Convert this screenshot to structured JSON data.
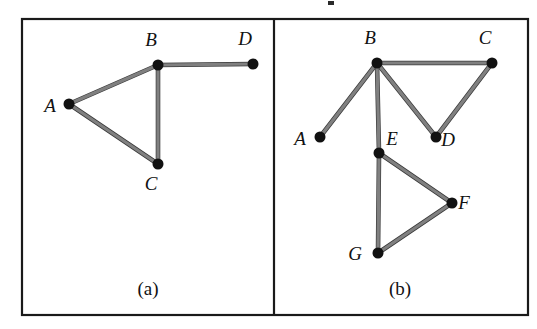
{
  "figure": {
    "type": "graph-diagram",
    "border_color": "#1a1a1a",
    "edge_color": "#808080",
    "edge_outline_color": "#3a3a3a",
    "node_color": "#111111",
    "label_color": "#111111",
    "background_color": "#ffffff",
    "frame": {
      "x": 21,
      "y": 18,
      "width": 508,
      "height": 298
    },
    "divider_x": 274,
    "node_radius": 5.5,
    "edge_width": 3.2
  },
  "panels": [
    {
      "id": "panel-a",
      "caption": "(a)",
      "caption_pos": {
        "x": 148,
        "y": 295
      },
      "nodes": [
        {
          "id": "A",
          "label": "A",
          "x": 69,
          "y": 104,
          "label_x": 50,
          "label_y": 112
        },
        {
          "id": "B",
          "label": "B",
          "x": 158,
          "y": 65,
          "label_x": 151,
          "label_y": 46
        },
        {
          "id": "C",
          "label": "C",
          "x": 158,
          "y": 164,
          "label_x": 151,
          "label_y": 190
        },
        {
          "id": "D",
          "label": "D",
          "x": 253,
          "y": 64,
          "label_x": 245,
          "label_y": 45
        }
      ],
      "edges": [
        {
          "from": "A",
          "to": "B"
        },
        {
          "from": "A",
          "to": "C"
        },
        {
          "from": "B",
          "to": "C"
        },
        {
          "from": "B",
          "to": "D"
        }
      ]
    },
    {
      "id": "panel-b",
      "caption": "(b)",
      "caption_pos": {
        "x": 400,
        "y": 295
      },
      "nodes": [
        {
          "id": "A",
          "label": "A",
          "x": 320,
          "y": 137,
          "label_x": 300,
          "label_y": 145
        },
        {
          "id": "B",
          "label": "B",
          "x": 377,
          "y": 63,
          "label_x": 370,
          "label_y": 44
        },
        {
          "id": "C",
          "label": "C",
          "x": 492,
          "y": 63,
          "label_x": 485,
          "label_y": 44
        },
        {
          "id": "D",
          "label": "D",
          "x": 436,
          "y": 137,
          "label_x": 448,
          "label_y": 146
        },
        {
          "id": "E",
          "label": "E",
          "x": 379,
          "y": 153,
          "label_x": 392,
          "label_y": 145
        },
        {
          "id": "F",
          "label": "F",
          "x": 452,
          "y": 203,
          "label_x": 464,
          "label_y": 209
        },
        {
          "id": "G",
          "label": "G",
          "x": 378,
          "y": 253,
          "label_x": 355,
          "label_y": 260
        }
      ],
      "edges": [
        {
          "from": "A",
          "to": "B"
        },
        {
          "from": "B",
          "to": "C"
        },
        {
          "from": "B",
          "to": "D"
        },
        {
          "from": "C",
          "to": "D"
        },
        {
          "from": "B",
          "to": "E"
        },
        {
          "from": "E",
          "to": "F"
        },
        {
          "from": "E",
          "to": "G"
        },
        {
          "from": "F",
          "to": "G"
        }
      ]
    }
  ],
  "artifacts": [
    {
      "name": "clipped-glyph-fragment",
      "x": 328,
      "y": 1,
      "width": 6,
      "height": 4
    }
  ]
}
